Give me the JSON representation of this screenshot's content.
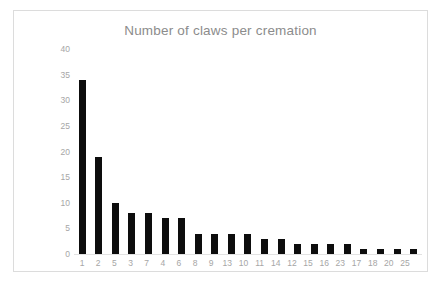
{
  "chart_data": {
    "type": "bar",
    "title": "Number of claws per cremation",
    "xlabel": "",
    "ylabel": "",
    "categories": [
      "1",
      "2",
      "5",
      "3",
      "7",
      "4",
      "6",
      "8",
      "9",
      "13",
      "10",
      "11",
      "14",
      "12",
      "15",
      "16",
      "23",
      "17",
      "18",
      "20",
      "25"
    ],
    "values": [
      34,
      19,
      10,
      8,
      8,
      7,
      7,
      4,
      4,
      4,
      4,
      3,
      3,
      2,
      2,
      2,
      2,
      1,
      1,
      1,
      1
    ],
    "ylim": [
      0,
      40
    ],
    "ytick_labels": [
      "40",
      "35",
      "30",
      "25",
      "20",
      "15",
      "10",
      "5",
      "0"
    ],
    "ytick_values": [
      40,
      35,
      30,
      25,
      20,
      15,
      10,
      5,
      0
    ],
    "grid": false,
    "legend": null,
    "series": [
      {
        "name": "Number of claws per cremation",
        "values": [
          34,
          19,
          10,
          8,
          8,
          7,
          7,
          4,
          4,
          4,
          4,
          3,
          3,
          2,
          2,
          2,
          2,
          1,
          1,
          1,
          1
        ]
      }
    ],
    "colors": {
      "bar": "#0d0d0d",
      "title": "#8c8c8c",
      "tick_label": "#a6a6a6",
      "frame": "#dcdcdc",
      "axis_line": "#e2e2e2",
      "background": "#ffffff"
    }
  }
}
